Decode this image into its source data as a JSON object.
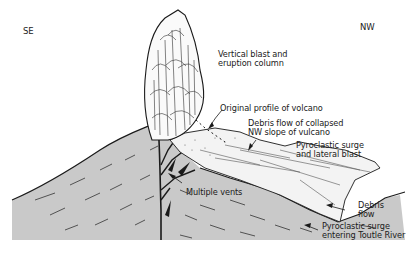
{
  "diagram": {
    "type": "volcano-cross-section",
    "orientation": {
      "left": "SE",
      "right": "NW"
    },
    "labels": {
      "vertical_blast": "Vertical blast and\neruption column",
      "original_profile": "Original profile of volcano",
      "debris_flow_collapsed": "Debris flow of collapsed\nNW slope of vulcano",
      "pyroclastic_lateral": "Pyroclastic surge\nand lateral blast",
      "multiple_vents": "Multiple vents",
      "debris_flow": "Debris\nflow",
      "pyroclastic_toutle": "Pyroclastic surge\nentering Toutle River"
    },
    "colors": {
      "ground_fill": "#c9c9c9",
      "line": "#1a1a1a",
      "background": "#ffffff"
    }
  }
}
